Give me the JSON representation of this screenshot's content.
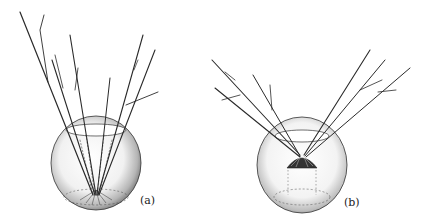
{
  "figure": {
    "panels": [
      {
        "id": "a",
        "label": "(a)",
        "description": "spherical bowl with twigs rooted at bottom, stems converging at base"
      },
      {
        "id": "b",
        "label": "(b)",
        "description": "spherical bowl with twigs held in a mound at center, stems splaying outward"
      }
    ],
    "colors": {
      "ink": "#222222",
      "glass_shade": "#9a9a9a",
      "background": "#ffffff"
    }
  }
}
